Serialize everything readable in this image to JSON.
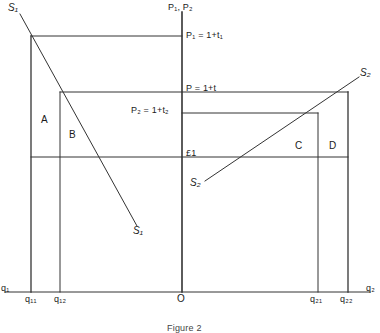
{
  "figure": {
    "caption": "Figure 2",
    "vertical_axis_label": "P₁, P₂",
    "origin_label": "O"
  },
  "price_levels": [
    {
      "id": "p1",
      "label": "P₁ = 1+t₁"
    },
    {
      "id": "p",
      "label": "P = 1+t"
    },
    {
      "id": "p2",
      "label": "P₂ = 1+t₂"
    },
    {
      "id": "one",
      "label": "£1"
    }
  ],
  "quantity_ticks": [
    {
      "id": "q1",
      "label": "q₁"
    },
    {
      "id": "q11",
      "label": "q₁₁"
    },
    {
      "id": "q12",
      "label": "q₁₂"
    },
    {
      "id": "q21",
      "label": "q₂₁"
    },
    {
      "id": "q22",
      "label": "q₂₂"
    },
    {
      "id": "q2",
      "label": "q₂"
    }
  ],
  "curves": [
    {
      "id": "s1_top",
      "label": "S₁"
    },
    {
      "id": "s1_bottom",
      "label": "S₁"
    },
    {
      "id": "s2_top",
      "label": "S₂"
    },
    {
      "id": "s2_bottom",
      "label": "S₂"
    }
  ],
  "regions": [
    {
      "id": "a",
      "label": "A"
    },
    {
      "id": "b",
      "label": "B"
    },
    {
      "id": "c",
      "label": "C"
    },
    {
      "id": "d",
      "label": "D"
    }
  ],
  "colors": {
    "line": "#333333",
    "text": "#1a1a1a",
    "background": "#ffffff"
  }
}
